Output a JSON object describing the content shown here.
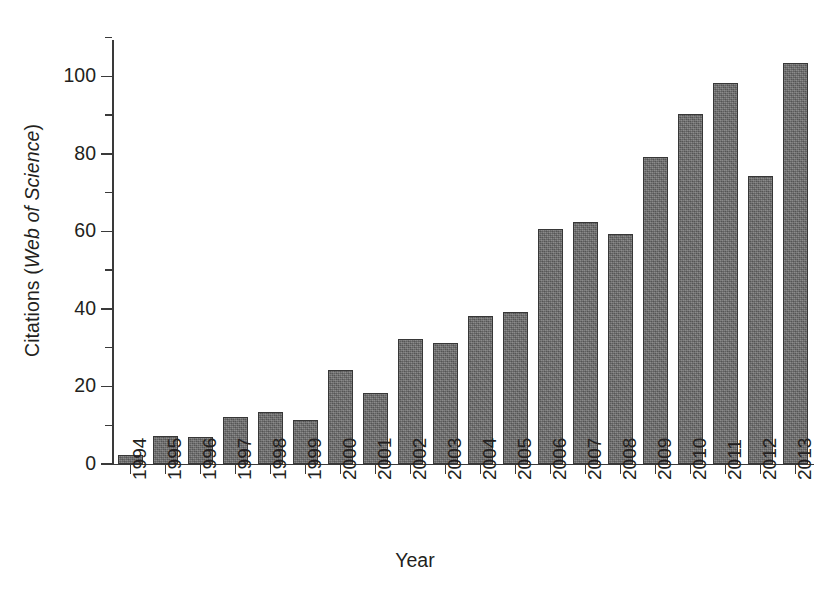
{
  "chart_data": {
    "type": "bar",
    "title": "",
    "xlabel": "Year",
    "ylabel_plain": "Citations (",
    "ylabel_italic": "Web of Science",
    "ylabel_close": ")",
    "ylabel_full": "Citations (Web of Science)",
    "categories": [
      "1994",
      "1995",
      "1996",
      "1997",
      "1998",
      "1999",
      "2000",
      "2001",
      "2002",
      "2003",
      "2004",
      "2005",
      "2006",
      "2007",
      "2008",
      "2009",
      "2010",
      "2011",
      "2012",
      "2013"
    ],
    "values": [
      2.3,
      7.2,
      7.0,
      12.2,
      13.3,
      11.3,
      24.2,
      18.3,
      32.3,
      31.2,
      38.2,
      39.3,
      60.5,
      62.4,
      59.4,
      79.3,
      90.2,
      98.3,
      74.3,
      103.4
    ],
    "series": [
      {
        "name": "Citations (Web of Science)",
        "values": [
          2.3,
          7.2,
          7.0,
          12.2,
          13.3,
          11.3,
          24.2,
          18.3,
          32.3,
          31.2,
          38.2,
          39.3,
          60.5,
          62.4,
          59.4,
          79.3,
          90.2,
          98.3,
          74.3,
          103.4
        ]
      }
    ],
    "ylim": [
      0,
      110
    ],
    "yticks_major": [
      0,
      20,
      40,
      60,
      80,
      100
    ],
    "yticks_major_labels": [
      "0",
      "20",
      "40",
      "60",
      "80",
      "100"
    ],
    "yticks_minor": [
      10,
      30,
      50,
      70,
      90,
      110
    ],
    "xlim_categories": 20,
    "grid": false,
    "legend": false,
    "legend_position": "none",
    "bar_color": "#6d6d6d",
    "bar_edge_color": "#373737",
    "axis_color": "#3a3a3a",
    "text_color": "#231f20",
    "background_color": "#ffffff",
    "xtick_label_rotation": 90
  }
}
